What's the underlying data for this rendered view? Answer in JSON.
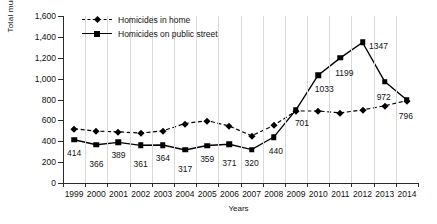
{
  "chart_data": {
    "type": "line",
    "title": "",
    "xlabel": "Years",
    "ylabel": "Total murders",
    "ylim": [
      0,
      1600
    ],
    "yticks": [
      "0",
      "200",
      "400",
      "600",
      "800",
      "1,000",
      "1,200",
      "1,400",
      "1,600"
    ],
    "ytick_values": [
      0,
      200,
      400,
      600,
      800,
      1000,
      1200,
      1400,
      1600
    ],
    "grid": "vertical",
    "legend_position": "top-left",
    "categories": [
      "1999",
      "2000",
      "2001",
      "2002",
      "2003",
      "2004",
      "2005",
      "2006",
      "2007",
      "2008",
      "2009",
      "2010",
      "2011",
      "2012",
      "2013",
      "2014"
    ],
    "series": [
      {
        "name": "Homicides in home",
        "style": "dashed",
        "marker": "diamond",
        "values": [
          520,
          497,
          490,
          478,
          500,
          570,
          598,
          545,
          452,
          552,
          690,
          690,
          672,
          700,
          740,
          790
        ],
        "labels": [
          "",
          "",
          "",
          "",
          "",
          "",
          "",
          "",
          "",
          "",
          "",
          "",
          "",
          "",
          "",
          ""
        ]
      },
      {
        "name": "Homicides on public street",
        "style": "solid",
        "marker": "square",
        "values": [
          414,
          366,
          389,
          361,
          364,
          317,
          359,
          371,
          320,
          440,
          701,
          1033,
          1199,
          1347,
          972,
          796
        ],
        "labels": [
          "414",
          "366",
          "389",
          "361",
          "364",
          "317",
          "359",
          "371",
          "320",
          "440",
          "701",
          "1033",
          "1199",
          "1347",
          "972",
          "796"
        ]
      }
    ],
    "colors": {
      "series_line": "#000000",
      "gridline": "#d9d9d9",
      "axis": "#2b2b2b",
      "background": "#ffffff",
      "text": "#111111"
    }
  },
  "legend": {
    "items": [
      {
        "label": "Homicides in home"
      },
      {
        "label": "Homicides on public street"
      }
    ]
  }
}
